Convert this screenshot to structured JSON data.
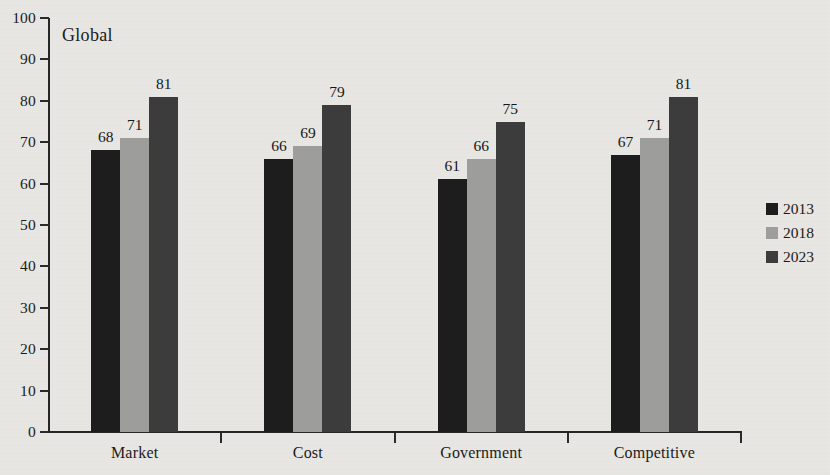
{
  "chart_data": {
    "type": "bar",
    "title": "Global",
    "xlabel": "",
    "ylabel": "",
    "ylim": [
      0,
      100
    ],
    "ytick_step": 10,
    "yticks": [
      0,
      10,
      20,
      30,
      40,
      50,
      60,
      70,
      80,
      90,
      100
    ],
    "grid": false,
    "legend_position": "right",
    "categories": [
      "Market",
      "Cost",
      "Government",
      "Competitive"
    ],
    "series": [
      {
        "name": "2013",
        "color": "#1d1d1d",
        "values": [
          68,
          66,
          61,
          67
        ]
      },
      {
        "name": "2018",
        "color": "#9d9d9b",
        "values": [
          71,
          69,
          66,
          71
        ]
      },
      {
        "name": "2023",
        "color": "#3c3c3c",
        "values": [
          81,
          79,
          75,
          81
        ]
      }
    ],
    "data_labels": [
      [
        68,
        71,
        81
      ],
      [
        66,
        69,
        79
      ],
      [
        61,
        66,
        75
      ],
      [
        67,
        71,
        81
      ]
    ]
  },
  "legend": {
    "items": [
      {
        "label": "2013"
      },
      {
        "label": "2018"
      },
      {
        "label": "2023"
      }
    ]
  }
}
